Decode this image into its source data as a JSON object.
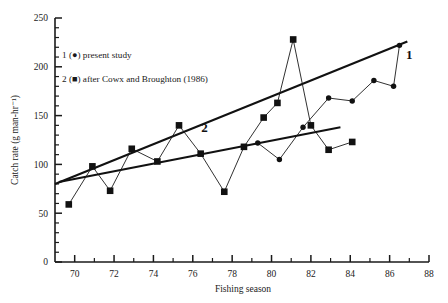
{
  "chart_data": {
    "type": "line",
    "title": "",
    "xlabel": "Fishing season",
    "ylabel": "Catch rate (g man-hr⁻¹)",
    "xlim": [
      69,
      88
    ],
    "ylim": [
      0,
      250
    ],
    "x_major_ticks": [
      70,
      72,
      74,
      76,
      78,
      80,
      82,
      84,
      86,
      88
    ],
    "x_tick_labels": [
      "70",
      "72",
      "74",
      "76",
      "78",
      "80",
      "82",
      "84",
      "86",
      "88"
    ],
    "x_minor_step": 1,
    "y_major_ticks": [
      0,
      50,
      100,
      150,
      200,
      250
    ],
    "y_tick_labels": [
      "0",
      "50",
      "100",
      "150",
      "200",
      "250"
    ],
    "y_minor_step": 10,
    "grid": false,
    "legend_position": "upper-left-inside",
    "series": [
      {
        "name": "present study",
        "key": "1",
        "marker": "circle",
        "legend_label": "1 (●) present study",
        "x": [
          79.3,
          80.4,
          81.6,
          82.9,
          84.1,
          85.2,
          86.2,
          86.5
        ],
        "values": [
          122,
          105,
          138,
          168,
          165,
          186,
          180,
          222
        ]
      },
      {
        "name": "after Cowx and Broughton (1986)",
        "key": "2",
        "marker": "square",
        "legend_label": "2 (■) after Cowx and Broughton (1986)",
        "x": [
          69.7,
          70.9,
          71.8,
          72.9,
          74.2,
          75.3,
          76.4,
          77.6,
          78.6,
          79.6,
          80.3,
          81.1,
          82.0,
          82.9,
          84.1
        ],
        "values": [
          59,
          98,
          73,
          116,
          103,
          140,
          111,
          72,
          118,
          148,
          163,
          228,
          140,
          115,
          123
        ]
      }
    ],
    "trend_lines": [
      {
        "name": "overall-regression",
        "x": [
          69.0,
          86.9
        ],
        "y": [
          80,
          226
        ]
      },
      {
        "name": "series2-regression",
        "x": [
          69.2,
          83.5
        ],
        "y": [
          82,
          138
        ]
      }
    ],
    "annotations": [
      {
        "text": "2",
        "x": 76.6,
        "y": 133
      },
      {
        "text": "1",
        "x": 87.0,
        "y": 208
      }
    ]
  },
  "legend": {
    "items": [
      {
        "index": "1",
        "symbol": "(●)",
        "label": "present study"
      },
      {
        "index": "2",
        "symbol": "(■)",
        "label": "after Cowx and Broughton (1986)"
      }
    ]
  }
}
